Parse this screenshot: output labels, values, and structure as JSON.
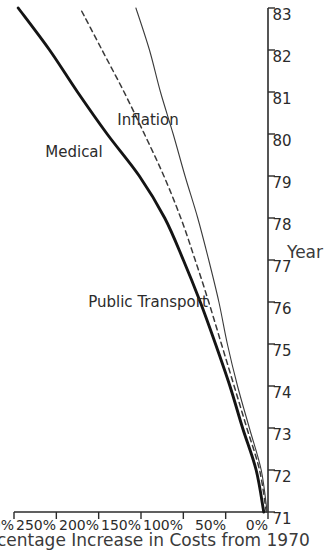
{
  "chart_data": {
    "type": "line",
    "title": "",
    "xlabel": "Year",
    "ylabel": "Percentage Increase in Costs from 1970",
    "orientation": "rotated-90-ccw",
    "grid": false,
    "legend": "inline-series-labels",
    "x": [
      71,
      72,
      73,
      74,
      75,
      76,
      77,
      78,
      79,
      80,
      81,
      82,
      83
    ],
    "xtick_labels": [
      "71",
      "72",
      "73",
      "74",
      "75",
      "76",
      "77",
      "78",
      "79",
      "80",
      "81",
      "82",
      "83"
    ],
    "xlim": [
      71,
      83
    ],
    "ylim": [
      0,
      300
    ],
    "ytick_values": [
      0,
      50,
      100,
      150,
      200,
      250,
      300
    ],
    "ytick_labels": [
      "0%",
      "50%",
      "100%",
      "150%",
      "200%",
      "250%",
      "300%"
    ],
    "series": [
      {
        "name": "Public Transport",
        "style": "solid-thick",
        "color": "#1a1a1a",
        "values": [
          5,
          14,
          30,
          45,
          62,
          80,
          100,
          122,
          152,
          190,
          225,
          258,
          295
        ]
      },
      {
        "name": "Medical",
        "style": "dashed",
        "color": "#3a3a3a",
        "values": [
          2,
          10,
          25,
          40,
          55,
          70,
          86,
          103,
          123,
          146,
          170,
          196,
          222
        ]
      },
      {
        "name": "Inflation",
        "style": "solid-thin",
        "color": "#3a3a3a",
        "values": [
          1,
          8,
          22,
          36,
          48,
          58,
          70,
          83,
          98,
          112,
          127,
          140,
          156
        ]
      }
    ]
  },
  "axes": {
    "x_title": "Year",
    "y_title": "Percentage Increase in Costs from 1970"
  },
  "series_labels": {
    "public_transport": "Public Transport",
    "medical": "Medical",
    "inflation": "Inflation"
  }
}
